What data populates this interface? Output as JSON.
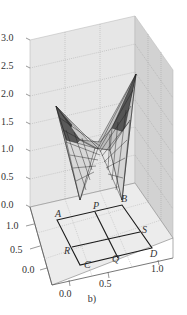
{
  "figure": {
    "caption": "b)",
    "type": "3d-surface-plot"
  },
  "z_axis": {
    "ticks": [
      "0.0",
      "0.5",
      "1.0",
      "1.5",
      "2.0",
      "2.5",
      "3.0"
    ],
    "range": [
      0.0,
      3.0
    ]
  },
  "x_axis": {
    "ticks": [
      "0.0",
      "0.5",
      "1.0"
    ]
  },
  "y_axis": {
    "ticks": [
      "0.0",
      "0.5",
      "1.0"
    ]
  },
  "points": {
    "A": "A",
    "B": "B",
    "C": "C",
    "D": "D",
    "P": "P",
    "Q": "Q",
    "R": "R",
    "S": "S"
  },
  "colors": {
    "box_face": "#e4e4e4",
    "box_side": "#cfcfcf",
    "floor": "#eaeaea",
    "grid": "#9a9a9a",
    "surface_light": "#d8d8d8",
    "surface_dark": "#555555",
    "rectangle": "#1a1a1a"
  }
}
